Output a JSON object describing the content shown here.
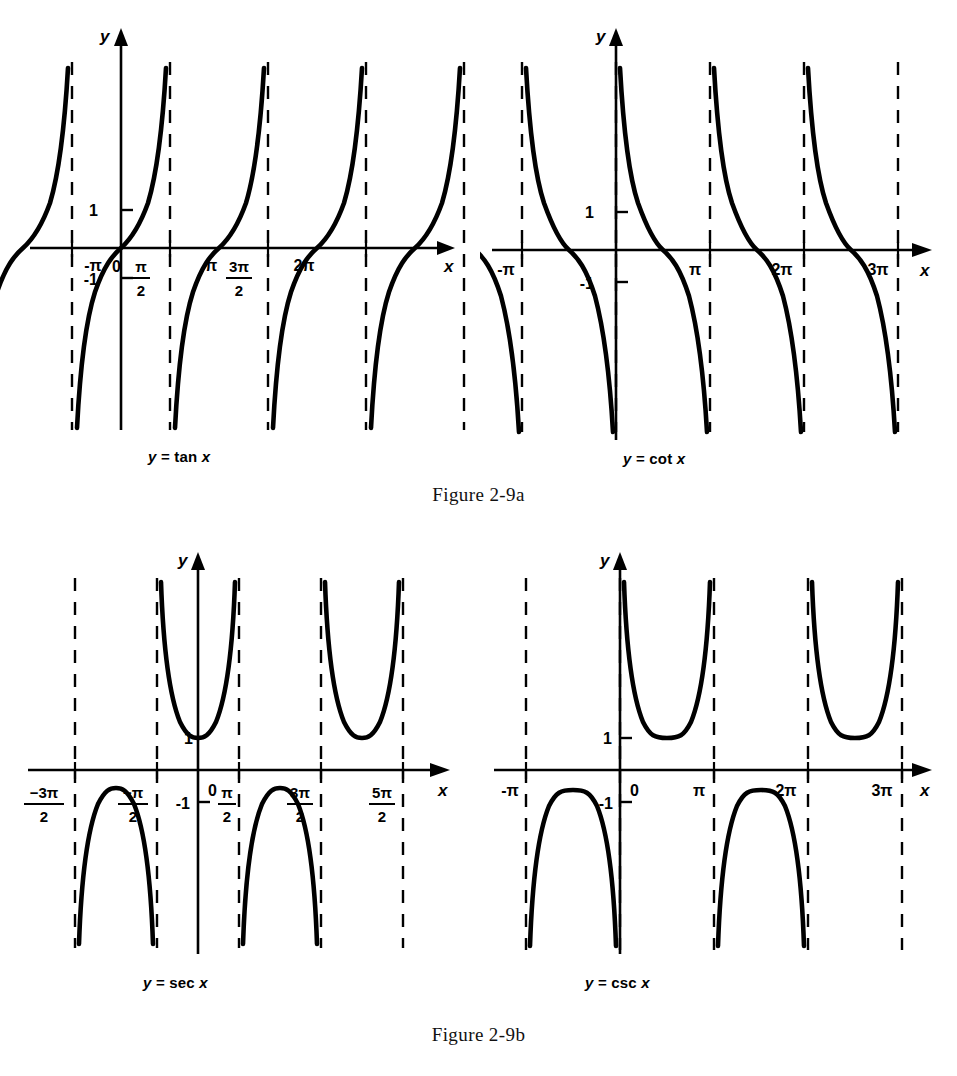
{
  "figure": {
    "caption_a": "Figure 2-9a",
    "caption_b": "Figure 2-9b"
  },
  "plots": {
    "tan": {
      "label": "y = tan x",
      "label_y": "y",
      "label_x": "x",
      "y_ticks": [
        "1",
        "-1"
      ],
      "x_ticks": [
        "-π",
        "0",
        "π/2",
        "π",
        "3π/2",
        "2π"
      ]
    },
    "cot": {
      "label": "y = cot x",
      "label_y": "y",
      "label_x": "x",
      "y_ticks": [
        "1",
        "-1"
      ],
      "x_ticks": [
        "-π",
        "π",
        "2π",
        "3π"
      ]
    },
    "sec": {
      "label": "y = sec x",
      "label_y": "y",
      "label_x": "x",
      "y_ticks": [
        "1",
        "-1"
      ],
      "x_ticks": [
        "-3π/2",
        "-π/2",
        "0",
        "π/2",
        "3π/2",
        "5π/2"
      ]
    },
    "csc": {
      "label": "y = csc x",
      "label_y": "y",
      "label_x": "x",
      "y_ticks": [
        "1",
        "-1"
      ],
      "x_ticks": [
        "-π",
        "0",
        "π",
        "2π",
        "3π"
      ]
    }
  },
  "chart_data": [
    {
      "type": "line",
      "title": "y = tan x",
      "xlabel": "x",
      "ylabel": "y",
      "function": "tan",
      "xlim": [
        -4.71238898038469,
        7.853981633974483
      ],
      "ylim": [
        -5.6,
        5.6
      ],
      "grid": false,
      "legend": false,
      "x_tick_values": [
        -3.141592653589793,
        0,
        1.5707963267948966,
        3.141592653589793,
        4.71238898038469,
        6.283185307179586
      ],
      "x_tick_labels": [
        "-π",
        "0",
        "π/2",
        "π",
        "3π/2",
        "2π"
      ],
      "y_tick_values": [
        1,
        -1
      ],
      "y_tick_labels": [
        "1",
        "-1"
      ],
      "asymptotes": [
        -4.71238898038469,
        -1.5707963267948966,
        1.5707963267948966,
        4.71238898038469,
        7.853981633974483
      ],
      "asymptote_labels": [
        "-3π/2",
        "-π/2",
        "π/2",
        "3π/2",
        "5π/2"
      ],
      "zeros": [
        -3.141592653589793,
        0,
        3.141592653589793,
        6.283185307179586
      ],
      "period": 3.141592653589793,
      "branches": 5,
      "notes": "Increasing branches from -inf to +inf on each interval between consecutive asymptotes; passes through (0,0) with slope 1."
    },
    {
      "type": "line",
      "title": "y = cot x",
      "xlabel": "x",
      "ylabel": "y",
      "function": "cot",
      "xlim": [
        -3.141592653589793,
        10.995574287564276
      ],
      "ylim": [
        -5.6,
        5.6
      ],
      "grid": false,
      "legend": false,
      "x_tick_values": [
        -3.141592653589793,
        3.141592653589793,
        6.283185307179586,
        9.42477796076938
      ],
      "x_tick_labels": [
        "-π",
        "π",
        "2π",
        "3π"
      ],
      "y_tick_values": [
        1,
        -1
      ],
      "y_tick_labels": [
        "1",
        "-1"
      ],
      "asymptotes": [
        -3.141592653589793,
        0,
        3.141592653589793,
        6.283185307179586,
        9.42477796076938
      ],
      "asymptote_labels": [
        "-π",
        "0",
        "π",
        "2π",
        "3π"
      ],
      "zeros": [
        -1.5707963267948966,
        1.5707963267948966,
        4.71238898038469,
        7.853981633974483
      ],
      "period": 3.141592653589793,
      "branches": 4,
      "notes": "Decreasing branches from +inf to -inf between consecutive multiples of pi; asymptotes at x = n*pi."
    },
    {
      "type": "line",
      "title": "y = sec x",
      "xlabel": "x",
      "ylabel": "y",
      "function": "sec",
      "xlim": [
        -4.71238898038469,
        7.853981633974483
      ],
      "ylim": [
        -5.2,
        5.2
      ],
      "grid": false,
      "legend": false,
      "x_tick_values": [
        -4.71238898038469,
        -1.5707963267948966,
        0,
        1.5707963267948966,
        4.71238898038469,
        7.853981633974483
      ],
      "x_tick_labels": [
        "-3π/2",
        "-π/2",
        "0",
        "π/2",
        "3π/2",
        "5π/2"
      ],
      "y_tick_values": [
        1,
        -1
      ],
      "y_tick_labels": [
        "1",
        "-1"
      ],
      "asymptotes": [
        -4.71238898038469,
        -1.5707963267948966,
        1.5707963267948966,
        4.71238898038469,
        7.853981633974483
      ],
      "asymptote_labels": [
        "-3π/2",
        "-π/2",
        "π/2",
        "3π/2",
        "5π/2"
      ],
      "minima": [
        [
          0,
          1
        ],
        [
          6.283185307179586,
          1
        ]
      ],
      "maxima": [
        [
          -3.141592653589793,
          -1
        ],
        [
          3.141592653589793,
          -1
        ]
      ],
      "period": 6.283185307179586,
      "branches": 4,
      "notes": "U-shaped branches with minimum y=1 above the axis at x = 2n*pi; inverted branches with maximum y=-1 below the axis at x = (2n+1)*pi."
    },
    {
      "type": "line",
      "title": "y = csc x",
      "xlabel": "x",
      "ylabel": "y",
      "function": "csc",
      "xlim": [
        -3.141592653589793,
        10.995574287564276
      ],
      "ylim": [
        -5.2,
        5.2
      ],
      "grid": false,
      "legend": false,
      "x_tick_values": [
        -3.141592653589793,
        0,
        3.141592653589793,
        6.283185307179586,
        9.42477796076938
      ],
      "x_tick_labels": [
        "-π",
        "0",
        "π",
        "2π",
        "3π"
      ],
      "y_tick_values": [
        1,
        -1
      ],
      "y_tick_labels": [
        "1",
        "-1"
      ],
      "asymptotes": [
        -3.141592653589793,
        0,
        3.141592653589793,
        6.283185307179586,
        9.42477796076938
      ],
      "asymptote_labels": [
        "-π",
        "0",
        "π",
        "2π",
        "3π"
      ],
      "minima": [
        [
          1.5707963267948966,
          1
        ],
        [
          7.853981633974483,
          1
        ]
      ],
      "maxima": [
        [
          -1.5707963267948966,
          -1
        ],
        [
          4.71238898038469,
          -1
        ]
      ],
      "period": 6.283185307179586,
      "branches": 4,
      "notes": "U-shaped branches with minimum y=1 on intervals (2n*pi,(2n+1)*pi); inverted branches with maximum y=-1 on intervals ((2n+1)*pi,(2n+2)*pi)."
    }
  ],
  "style": {
    "ink": "#000000",
    "paper": "#ffffff"
  }
}
